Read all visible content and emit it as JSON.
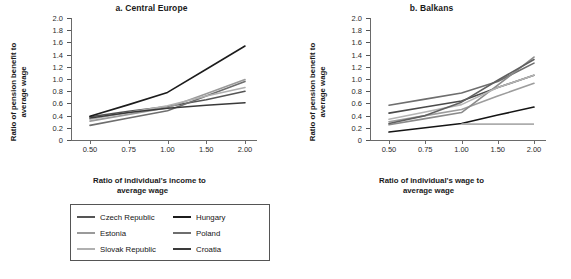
{
  "figure": {
    "panels": [
      {
        "id": "a",
        "title": "a. Central Europe",
        "xlabel_line1": "Ratio of individual's income to",
        "xlabel_line2": "average wage",
        "ylabel_line1": "Ratio of pension benefit to",
        "ylabel_line2": "average wage"
      },
      {
        "id": "b",
        "title": "b. Balkans",
        "xlabel_line1": "Ratio of individual's wage to",
        "xlabel_line2": "average wage",
        "ylabel_line1": "Ratio of pension benefit to",
        "ylabel_line2": "average wage"
      }
    ]
  },
  "chart_data": [
    {
      "type": "line",
      "title": "a. Central Europe",
      "xlabel": "Ratio of individual's income to average wage",
      "ylabel": "Ratio of pension benefit to average wage",
      "x": [
        0.5,
        0.75,
        1.0,
        1.5,
        2.0
      ],
      "xtick_labels": [
        "0.50",
        "0.75",
        "1.00",
        "1.50",
        "2.00"
      ],
      "ytick_labels": [
        "0",
        "0.2",
        "0.4",
        "0.6",
        "0.8",
        "1.0",
        "1.2",
        "1.4",
        "1.6",
        "1.8",
        "2.0"
      ],
      "ylim": [
        0,
        2.0
      ],
      "ytick_step": 0.2,
      "grid": false,
      "legend_position": "below",
      "series": [
        {
          "name": "Czech Republic",
          "color": "#555555",
          "values": [
            0.38,
            0.47,
            0.55,
            0.66,
            0.8
          ]
        },
        {
          "name": "Hungary",
          "color": "#1c1c1c",
          "values": [
            0.39,
            0.58,
            0.78,
            1.16,
            1.54
          ]
        },
        {
          "name": "Estonia",
          "color": "#9a9a9a",
          "values": [
            0.31,
            0.42,
            0.53,
            0.76,
            0.99
          ]
        },
        {
          "name": "Poland",
          "color": "#6e6e6e",
          "values": [
            0.24,
            0.36,
            0.48,
            0.72,
            0.96
          ]
        },
        {
          "name": "Slovak Republic",
          "color": "#b0b0b0",
          "values": [
            0.34,
            0.45,
            0.56,
            0.72,
            0.86
          ]
        },
        {
          "name": "Croatia",
          "color": "#3a3a3a",
          "values": [
            0.36,
            0.45,
            0.52,
            0.57,
            0.61
          ]
        }
      ]
    },
    {
      "type": "line",
      "title": "b. Balkans",
      "xlabel": "Ratio of individual's wage to average wage",
      "ylabel": "Ratio of pension benefit to average wage",
      "x": [
        0.5,
        0.75,
        1.0,
        1.5,
        2.0
      ],
      "xtick_labels": [
        "0.50",
        "0.75",
        "1.00",
        "1.50",
        "2.00"
      ],
      "ytick_labels": [
        "0",
        "0.2",
        "0.4",
        "0.6",
        "0.8",
        "1.0",
        "1.2",
        "1.4",
        "1.6",
        "1.8",
        "2.0"
      ],
      "ylim": [
        0,
        2.0
      ],
      "ytick_step": 0.2,
      "grid": false,
      "legend_position": "below",
      "series": [
        {
          "name": "Albania",
          "color": "#6e6e6e",
          "values": [
            0.57,
            0.67,
            0.77,
            0.96,
            1.26
          ]
        },
        {
          "name": "Kosovo",
          "color": "#4a4a4a",
          "values": [
            0.44,
            0.54,
            0.64,
            0.86,
            1.06
          ]
        },
        {
          "name": "BiH Federation",
          "color": "#9d9d9d",
          "values": [
            0.3,
            0.4,
            0.5,
            0.72,
            0.93
          ]
        },
        {
          "name": "Macedonia, FYR",
          "color": "#8a8a8a",
          "values": [
            0.25,
            0.35,
            0.45,
            0.9,
            1.36
          ]
        },
        {
          "name": "Serbia",
          "color": "#b4b4b4",
          "values": [
            0.34,
            0.46,
            0.58,
            0.86,
            1.06
          ]
        },
        {
          "name": "Republika Srpska",
          "color": "#606060",
          "values": [
            0.27,
            0.4,
            0.62,
            0.98,
            1.32
          ]
        },
        {
          "name": "Montenegro",
          "color": "#141414",
          "values": [
            0.13,
            0.2,
            0.27,
            0.41,
            0.54
          ]
        }
      ]
    }
  ],
  "flat_overlay": {
    "name": "Montenegro flat segment",
    "color": "#adadad",
    "value": 0.26
  }
}
